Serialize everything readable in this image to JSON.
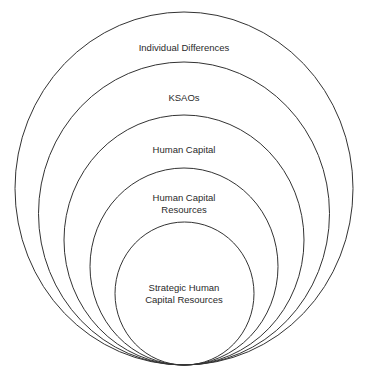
{
  "diagram": {
    "type": "nested-circles",
    "stroke_color": "#333333",
    "background": "#ffffff",
    "circles": [
      {
        "label": "Individual Differences",
        "cx": 184,
        "cy": 188.5,
        "rx": 169,
        "ry": 176.5
      },
      {
        "label": "KSAOs",
        "cx": 184,
        "cy": 213.5,
        "rx": 145.5,
        "ry": 151.5
      },
      {
        "label": "Human Capital",
        "cx": 184,
        "cy": 240,
        "rx": 120,
        "ry": 125
      },
      {
        "label_line1": "Human Capital",
        "label_line2": "Resources",
        "cx": 184,
        "cy": 266.5,
        "rx": 94,
        "ry": 98.5
      },
      {
        "label_line1": "Strategic Human",
        "label_line2": "Capital Resources",
        "cx": 184.5,
        "cy": 293.5,
        "rx": 69.5,
        "ry": 71.5
      }
    ]
  }
}
